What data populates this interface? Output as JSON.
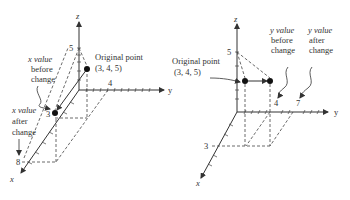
{
  "left_diagram": {
    "axes": {
      "x": "x",
      "y": "y",
      "z": "z"
    },
    "tick_labels": {
      "z5": "5",
      "y4": "4",
      "x3": "3",
      "x8": "8"
    },
    "original_point": {
      "label": "Original point",
      "coords": "(3, 4, 5)"
    },
    "annotation_before": [
      "x value",
      "before",
      "change"
    ],
    "annotation_after": [
      "x value",
      "after",
      "change"
    ]
  },
  "right_diagram": {
    "axes": {
      "x": "x",
      "y": "y",
      "z": "z"
    },
    "tick_labels": {
      "z5": "5",
      "y4": "4",
      "y7": "7",
      "x3": "3"
    },
    "original_point": {
      "label": "Original point",
      "coords": "(3, 4, 5)"
    },
    "annotation_before": [
      "y value",
      "before",
      "change"
    ],
    "annotation_after": [
      "y value",
      "after",
      "change"
    ]
  },
  "colors": {
    "ink": "#333333",
    "background": "#ffffff"
  }
}
